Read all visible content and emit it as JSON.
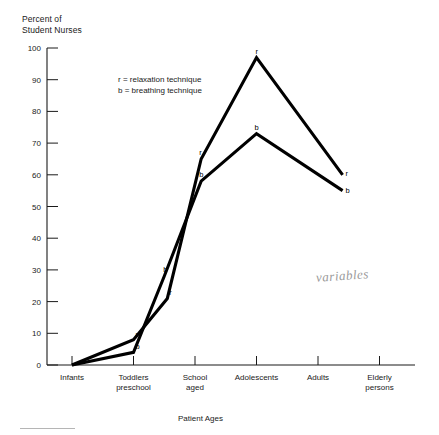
{
  "axis_title_y": "Percent of\nStudent Nurses",
  "axis_title_x": "Patient Ages",
  "legend_text": "r = relaxation technique\nb = breathing technique",
  "annotation": "variables",
  "colors": {
    "ink": "#1a1a1a",
    "line": "#000000",
    "annotation": "#9a9a9a"
  },
  "chart_data": {
    "type": "line",
    "title": "",
    "xlabel": "Patient Ages",
    "ylabel": "Percent of Student Nurses",
    "ylim": [
      0,
      100
    ],
    "yticks": [
      0,
      10,
      20,
      30,
      40,
      50,
      60,
      70,
      80,
      90,
      100
    ],
    "ytick_labels": [
      "0",
      "10",
      "20",
      "30",
      "40",
      "50",
      "60",
      "70",
      "80",
      "90",
      "100"
    ],
    "grid": false,
    "legend_position": "upper-left-inset",
    "categories": [
      "Infants",
      "Toddlers\npreschool",
      "School\naged",
      "Adolescents",
      "Adults",
      "Elderly\npersons"
    ],
    "category_labels_line1": [
      "Infants",
      "Toddlers",
      "School",
      "Adolescents",
      "Adults",
      "Elderly"
    ],
    "category_labels_line2": [
      "",
      "preschool",
      "aged",
      "",
      "",
      "persons"
    ],
    "series": [
      {
        "name": "r = relaxation technique",
        "key": "r",
        "point_label": "r",
        "x": [
          0,
          1,
          1.55,
          2.1,
          3,
          4.4
        ],
        "values": [
          0,
          8,
          21,
          65,
          97,
          60
        ]
      },
      {
        "name": "b = breathing technique",
        "key": "b",
        "point_label": "b",
        "x": [
          0,
          1,
          1.5,
          2.1,
          3,
          4.4
        ],
        "values": [
          0,
          4,
          28,
          58,
          73,
          55
        ]
      }
    ],
    "point_labels": [
      {
        "series": "r",
        "label": "r",
        "x": 1.0,
        "y": 8,
        "dx": 2,
        "dy": -3
      },
      {
        "series": "b",
        "label": "b",
        "x": 1.0,
        "y": 4,
        "dx": 2,
        "dy": -3
      },
      {
        "series": "b",
        "label": "b",
        "x": 1.5,
        "y": 28,
        "dx": -1,
        "dy": -4
      },
      {
        "series": "r",
        "label": "r",
        "x": 1.55,
        "y": 21,
        "dx": 2,
        "dy": -3
      },
      {
        "series": "r",
        "label": "r",
        "x": 2.1,
        "y": 65,
        "dx": -2,
        "dy": -4
      },
      {
        "series": "b",
        "label": "b",
        "x": 2.1,
        "y": 58,
        "dx": -2,
        "dy": -4
      },
      {
        "series": "r",
        "label": "r",
        "x": 3.0,
        "y": 97,
        "dx": -1,
        "dy": -4
      },
      {
        "series": "b",
        "label": "b",
        "x": 3.0,
        "y": 73,
        "dx": -2,
        "dy": -4
      },
      {
        "series": "r",
        "label": "r",
        "x": 4.4,
        "y": 60,
        "dx": 3,
        "dy": 1
      },
      {
        "series": "b",
        "label": "b",
        "x": 4.4,
        "y": 55,
        "dx": 3,
        "dy": 2
      }
    ]
  }
}
